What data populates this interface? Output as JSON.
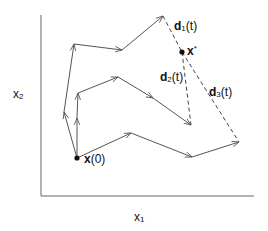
{
  "axes": {
    "x_label": "x",
    "x_label_sub": "1",
    "y_label": "x",
    "y_label_sub": "2"
  },
  "points": {
    "start": {
      "label": "x",
      "suffix": "(0)",
      "x": 77,
      "y": 158
    },
    "optimum": {
      "label": "x",
      "sup": "*",
      "x": 182,
      "y": 52
    }
  },
  "distances": [
    {
      "label": "d",
      "sub": "1",
      "suffix": "(t)"
    },
    {
      "label": "d",
      "sub": "2",
      "suffix": "(t)"
    },
    {
      "label": "d",
      "sub": "3",
      "suffix": "(t)"
    }
  ],
  "trajectories": [
    {
      "name": "path-1",
      "points": [
        [
          77,
          158
        ],
        [
          64,
          112
        ],
        [
          74,
          44
        ],
        [
          122,
          50
        ],
        [
          163,
          16
        ]
      ]
    },
    {
      "name": "path-2",
      "points": [
        [
          77,
          158
        ],
        [
          77,
          112
        ],
        [
          78,
          93
        ],
        [
          118,
          77
        ],
        [
          191,
          125
        ]
      ]
    },
    {
      "name": "path-3",
      "points": [
        [
          77,
          158
        ],
        [
          131,
          133
        ],
        [
          192,
          157
        ],
        [
          239,
          142
        ]
      ]
    }
  ],
  "colors": {
    "line": "#555555",
    "dash": "#444444",
    "text": "#111111"
  }
}
